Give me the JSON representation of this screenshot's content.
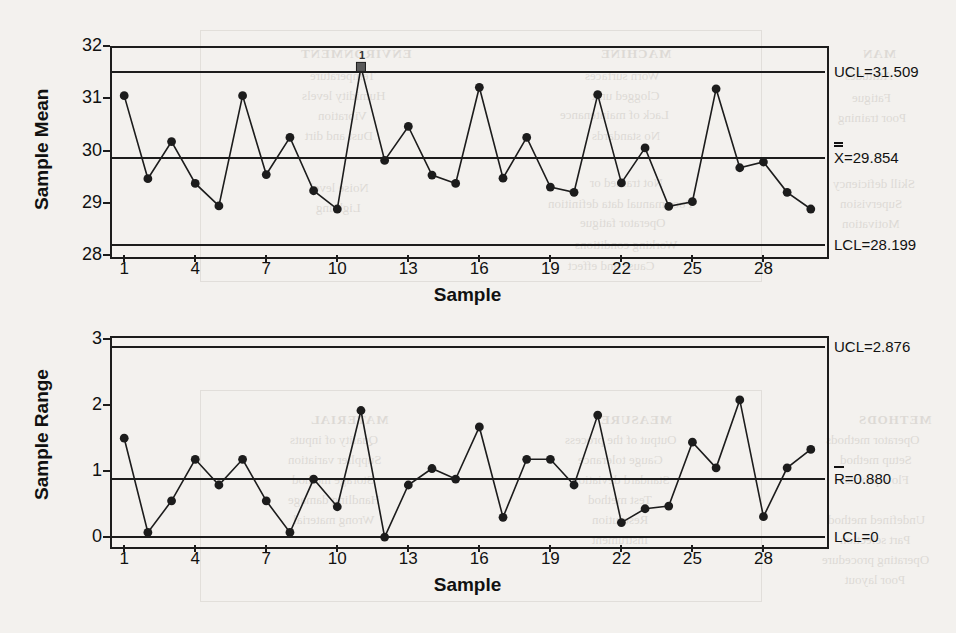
{
  "page": {
    "background_color": "#f3f1ee",
    "ink_color": "#1c1c1c"
  },
  "bleed_through_text": [
    {
      "text": "MACHINE",
      "x": 600,
      "y": 46,
      "size": 13,
      "bold": true
    },
    {
      "text": "Worn surfaces",
      "x": 585,
      "y": 68,
      "size": 13,
      "bold": false
    },
    {
      "text": "Clogged unit",
      "x": 592,
      "y": 88,
      "size": 13,
      "bold": false
    },
    {
      "text": "Lack of maintenance",
      "x": 560,
      "y": 107,
      "size": 13,
      "bold": false
    },
    {
      "text": "No standards",
      "x": 592,
      "y": 128,
      "size": 13,
      "bold": false
    },
    {
      "text": "Not trained or",
      "x": 590,
      "y": 175,
      "size": 13,
      "bold": false
    },
    {
      "text": "Poor manual data definition",
      "x": 548,
      "y": 196,
      "size": 13,
      "bold": false
    },
    {
      "text": "Operator fatigue",
      "x": 580,
      "y": 215,
      "size": 13,
      "bold": false
    },
    {
      "text": "Working conditions",
      "x": 575,
      "y": 237,
      "size": 13,
      "bold": false
    },
    {
      "text": "Cause and effect",
      "x": 568,
      "y": 258,
      "size": 13,
      "bold": false
    },
    {
      "text": "MAN",
      "x": 862,
      "y": 46,
      "size": 13,
      "bold": true
    },
    {
      "text": "Attitudes",
      "x": 845,
      "y": 68,
      "size": 13,
      "bold": false
    },
    {
      "text": "Fatigue",
      "x": 852,
      "y": 90,
      "size": 13,
      "bold": false
    },
    {
      "text": "Poor training",
      "x": 838,
      "y": 110,
      "size": 13,
      "bold": false
    },
    {
      "text": "Skill deficiency",
      "x": 833,
      "y": 176,
      "size": 13,
      "bold": false
    },
    {
      "text": "Supervision",
      "x": 840,
      "y": 196,
      "size": 13,
      "bold": false
    },
    {
      "text": "Motivation",
      "x": 842,
      "y": 216,
      "size": 13,
      "bold": false
    },
    {
      "text": "MEASURE",
      "x": 600,
      "y": 412,
      "size": 13,
      "bold": true
    },
    {
      "text": "Output of the process",
      "x": 565,
      "y": 432,
      "size": 13,
      "bold": false
    },
    {
      "text": "Gauge tolerance",
      "x": 578,
      "y": 452,
      "size": 13,
      "bold": false
    },
    {
      "text": "Standard deviation",
      "x": 572,
      "y": 472,
      "size": 13,
      "bold": false
    },
    {
      "text": "Test method",
      "x": 588,
      "y": 492,
      "size": 13,
      "bold": false
    },
    {
      "text": "Resolution",
      "x": 592,
      "y": 512,
      "size": 13,
      "bold": false
    },
    {
      "text": "Instrument",
      "x": 592,
      "y": 532,
      "size": 13,
      "bold": false
    },
    {
      "text": "METHODS",
      "x": 858,
      "y": 412,
      "size": 13,
      "bold": true
    },
    {
      "text": "Operator methods",
      "x": 826,
      "y": 432,
      "size": 13,
      "bold": false
    },
    {
      "text": "Setup method",
      "x": 840,
      "y": 452,
      "size": 13,
      "bold": false
    },
    {
      "text": "Flow process",
      "x": 840,
      "y": 472,
      "size": 13,
      "bold": false
    },
    {
      "text": "Undefined method",
      "x": 828,
      "y": 512,
      "size": 13,
      "bold": false
    },
    {
      "text": "Part selection",
      "x": 840,
      "y": 532,
      "size": 13,
      "bold": false
    },
    {
      "text": "Operating procedure",
      "x": 822,
      "y": 552,
      "size": 13,
      "bold": false
    },
    {
      "text": "Poor layout",
      "x": 845,
      "y": 572,
      "size": 13,
      "bold": false
    },
    {
      "text": "MATERIAL",
      "x": 310,
      "y": 412,
      "size": 13,
      "bold": true
    },
    {
      "text": "Quality of inputs",
      "x": 290,
      "y": 432,
      "size": 13,
      "bold": false
    },
    {
      "text": "Supplier variation",
      "x": 288,
      "y": 452,
      "size": 13,
      "bold": false
    },
    {
      "text": "Storage method",
      "x": 292,
      "y": 472,
      "size": 13,
      "bold": false
    },
    {
      "text": "Handling damage",
      "x": 288,
      "y": 492,
      "size": 13,
      "bold": false
    },
    {
      "text": "Wrong material",
      "x": 293,
      "y": 512,
      "size": 13,
      "bold": false
    },
    {
      "text": "ENVIRONMENT",
      "x": 300,
      "y": 46,
      "size": 13,
      "bold": true
    },
    {
      "text": "Temperature",
      "x": 310,
      "y": 68,
      "size": 13,
      "bold": false
    },
    {
      "text": "Humidity levels",
      "x": 302,
      "y": 88,
      "size": 13,
      "bold": false
    },
    {
      "text": "Vibration",
      "x": 318,
      "y": 108,
      "size": 13,
      "bold": false
    },
    {
      "text": "Dust and dirt",
      "x": 305,
      "y": 128,
      "size": 13,
      "bold": false
    },
    {
      "text": "Noise level",
      "x": 310,
      "y": 180,
      "size": 13,
      "bold": false
    },
    {
      "text": "Lighting",
      "x": 316,
      "y": 200,
      "size": 13,
      "bold": false
    }
  ],
  "charts": [
    {
      "id": "xbar-chart",
      "name": "sample-mean-control-chart",
      "chart_data": {
        "type": "line",
        "title": "",
        "xlabel": "Sample",
        "ylabel": "Sample Mean",
        "xlim": [
          0.4,
          30.6
        ],
        "ylim": [
          28,
          32
        ],
        "grid": false,
        "legend_position": "right-outside",
        "y_ticks": [
          "32",
          "31",
          "30",
          "29",
          "28"
        ],
        "y_tick_values": [
          32,
          31,
          30,
          29,
          28
        ],
        "x_ticks": [
          "1",
          "4",
          "7",
          "10",
          "13",
          "16",
          "19",
          "22",
          "25",
          "28"
        ],
        "x_tick_values": [
          1,
          4,
          7,
          10,
          13,
          16,
          19,
          22,
          25,
          28
        ],
        "x": [
          1,
          2,
          3,
          4,
          5,
          6,
          7,
          8,
          9,
          10,
          11,
          12,
          13,
          14,
          15,
          16,
          17,
          18,
          19,
          20,
          21,
          22,
          23,
          24,
          25,
          26,
          27,
          28,
          29,
          30
        ],
        "values": [
          31.05,
          29.46,
          30.17,
          29.37,
          28.94,
          31.05,
          29.54,
          30.25,
          29.23,
          28.88,
          31.6,
          29.81,
          30.46,
          29.53,
          29.37,
          31.21,
          29.47,
          30.25,
          29.3,
          29.2,
          31.07,
          29.38,
          30.05,
          28.93,
          29.02,
          31.18,
          29.67,
          29.78,
          29.2,
          28.88
        ],
        "annotations": [
          {
            "label": "UCL=31.509",
            "value": 31.509,
            "name": "upper-control-limit"
          },
          {
            "label": "X=29.854",
            "value": 29.854,
            "name": "center-line-xbarbar",
            "double_bar": true,
            "symbol": "X"
          },
          {
            "label": "LCL=28.199",
            "value": 28.199,
            "name": "lower-control-limit"
          }
        ],
        "violations": [
          {
            "sample": 11,
            "value": 31.6,
            "rule_label": "1"
          }
        ]
      }
    },
    {
      "id": "r-chart",
      "name": "sample-range-control-chart",
      "chart_data": {
        "type": "line",
        "title": "",
        "xlabel": "Sample",
        "ylabel": "Sample Range",
        "xlim": [
          0.4,
          30.6
        ],
        "ylim": [
          -0.12,
          3.05
        ],
        "grid": false,
        "legend_position": "right-outside",
        "y_ticks": [
          "3",
          "2",
          "1",
          "0"
        ],
        "y_tick_values": [
          3,
          2,
          1,
          0
        ],
        "x_ticks": [
          "1",
          "4",
          "7",
          "10",
          "13",
          "16",
          "19",
          "22",
          "25",
          "28"
        ],
        "x_tick_values": [
          1,
          4,
          7,
          10,
          13,
          16,
          19,
          22,
          25,
          28
        ],
        "x": [
          1,
          2,
          3,
          4,
          5,
          6,
          7,
          8,
          9,
          10,
          11,
          12,
          13,
          14,
          15,
          16,
          17,
          18,
          19,
          20,
          21,
          22,
          23,
          24,
          25,
          26,
          27,
          28,
          29,
          30
        ],
        "values": [
          1.5,
          0.07,
          0.55,
          1.18,
          0.79,
          1.18,
          0.55,
          0.07,
          0.88,
          0.46,
          1.92,
          0.0,
          0.79,
          1.04,
          0.88,
          1.67,
          0.3,
          1.18,
          1.18,
          0.79,
          1.85,
          0.22,
          0.43,
          0.47,
          1.44,
          1.05,
          2.08,
          0.31,
          1.05,
          1.33,
          1.27
        ],
        "annotations": [
          {
            "label": "UCL=2.876",
            "value": 2.876,
            "name": "upper-control-limit"
          },
          {
            "label": "R=0.880",
            "value": 0.88,
            "name": "center-line-rbar",
            "double_bar": false,
            "symbol": "R"
          },
          {
            "label": "LCL=0",
            "value": 0.0,
            "name": "lower-control-limit"
          }
        ],
        "violations": []
      }
    }
  ]
}
